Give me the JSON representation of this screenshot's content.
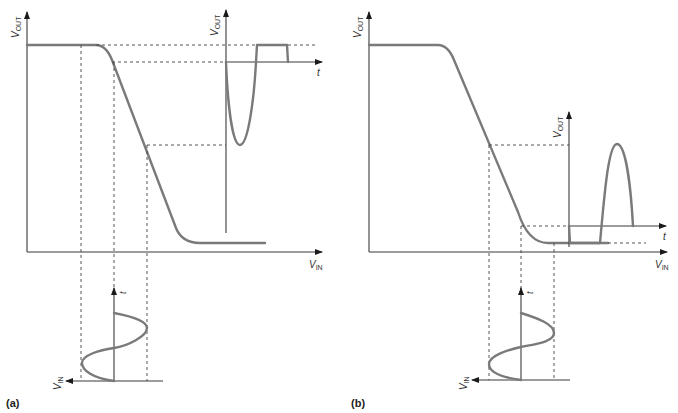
{
  "figure": {
    "panels": [
      {
        "id": "a",
        "label": "(a)",
        "transfer_axes": {
          "y_label": "V",
          "y_sub": "OUT",
          "x_label": "V",
          "x_sub": "IN"
        },
        "inset_output": {
          "y_label": "V",
          "y_sub": "OUT",
          "t_label": "t",
          "description": "Output clipped: large negative lobe, flattened positive top"
        },
        "input_signal": {
          "t_label": "t",
          "x_label": "V",
          "x_sub": "IN",
          "description": "Sinusoidal input biased near upper knee"
        }
      },
      {
        "id": "b",
        "label": "(b)",
        "transfer_axes": {
          "y_label": "V",
          "y_sub": "OUT",
          "x_label": "V",
          "x_sub": "IN"
        },
        "inset_output": {
          "y_label": "V",
          "y_sub": "OUT",
          "t_label": "t",
          "description": "Output clipped: flattened negative half, positive lobe"
        },
        "input_signal": {
          "t_label": "t",
          "x_label": "V",
          "x_sub": "IN",
          "description": "Sinusoidal input biased near lower knee"
        }
      }
    ],
    "colors": {
      "curve": "#7a7a7a",
      "axis": "#3a3a3a",
      "dash": "#444444"
    }
  }
}
